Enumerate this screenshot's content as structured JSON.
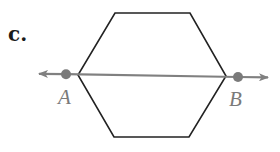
{
  "figure": {
    "part_label": "c.",
    "shape": "hexagon",
    "line": {
      "type": "line",
      "through_points": [
        "A",
        "B"
      ],
      "arrows": "both-ends"
    },
    "points": [
      {
        "name": "A"
      },
      {
        "name": "B"
      }
    ],
    "colors": {
      "hexagon_stroke": "#222222",
      "line_stroke": "#808080",
      "point_fill": "#7a7a7a",
      "label_color": "#7a7a7a"
    }
  }
}
